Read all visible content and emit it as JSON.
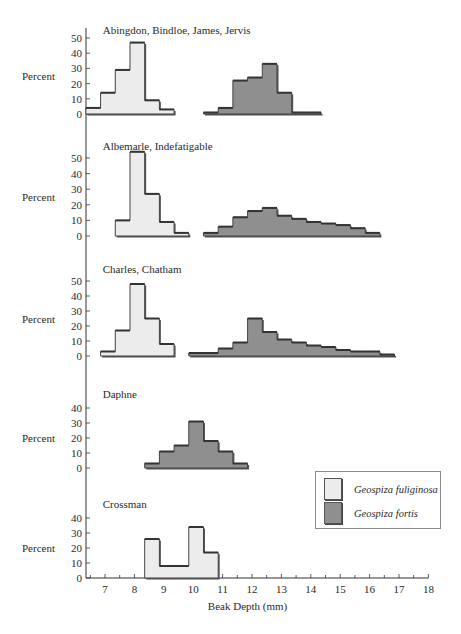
{
  "chart_data": {
    "type": "bar",
    "subtype": "stacked-panel histogram",
    "xlabel": "Beak Depth (mm)",
    "ylabel": "Percent",
    "x_ticks": [
      7,
      8,
      9,
      10,
      11,
      12,
      13,
      14,
      15,
      16,
      17,
      18
    ],
    "xlim": [
      6.5,
      18
    ],
    "bin_width_mm": 0.5,
    "colors": {
      "Geospiza fuliginosa": "#ececec",
      "Geospiza fortis": "#8f8f8f",
      "outline": "#444444"
    },
    "legend": {
      "position": "lower right",
      "entries": [
        {
          "label": "Geospiza fuliginosa",
          "color": "#ececec"
        },
        {
          "label": "Geospiza fortis",
          "color": "#8f8f8f"
        }
      ]
    },
    "panels": [
      {
        "title": "Abingdon, Bindloe, James, Jervis",
        "y_ticks": [
          0,
          10,
          20,
          30,
          40,
          50
        ],
        "ylim": [
          0,
          50
        ],
        "series": [
          {
            "name": "Geospiza fuliginosa",
            "bins": [
              [
                6.35,
                6.85,
                4
              ],
              [
                6.85,
                7.35,
                14
              ],
              [
                7.35,
                7.85,
                29
              ],
              [
                7.85,
                8.35,
                47
              ],
              [
                8.35,
                8.85,
                9
              ],
              [
                8.85,
                9.35,
                3
              ]
            ]
          },
          {
            "name": "Geospiza fortis",
            "bins": [
              [
                10.35,
                10.85,
                1
              ],
              [
                10.85,
                11.35,
                4
              ],
              [
                11.35,
                11.85,
                22
              ],
              [
                11.85,
                12.35,
                24
              ],
              [
                12.35,
                12.85,
                33
              ],
              [
                12.85,
                13.35,
                14
              ],
              [
                13.35,
                13.85,
                1
              ],
              [
                13.85,
                14.35,
                1
              ]
            ]
          }
        ]
      },
      {
        "title": "Albemarle, Indefatigable",
        "y_ticks": [
          0,
          10,
          20,
          30,
          40,
          50
        ],
        "ylim": [
          0,
          55
        ],
        "series": [
          {
            "name": "Geospiza fuliginosa",
            "bins": [
              [
                7.35,
                7.85,
                10
              ],
              [
                7.85,
                8.35,
                54
              ],
              [
                8.35,
                8.85,
                27
              ],
              [
                8.85,
                9.35,
                9
              ],
              [
                9.35,
                9.85,
                2
              ]
            ]
          },
          {
            "name": "Geospiza fortis",
            "bins": [
              [
                10.35,
                10.85,
                2
              ],
              [
                10.85,
                11.35,
                6
              ],
              [
                11.35,
                11.85,
                12
              ],
              [
                11.85,
                12.35,
                16
              ],
              [
                12.35,
                12.85,
                18
              ],
              [
                12.85,
                13.35,
                13
              ],
              [
                13.35,
                13.85,
                11
              ],
              [
                13.85,
                14.35,
                9
              ],
              [
                14.35,
                14.85,
                8
              ],
              [
                14.85,
                15.35,
                7
              ],
              [
                15.35,
                15.85,
                5
              ],
              [
                15.85,
                16.35,
                2
              ]
            ]
          }
        ]
      },
      {
        "title": "Charles, Chatham",
        "y_ticks": [
          0,
          10,
          20,
          30,
          40,
          50
        ],
        "ylim": [
          0,
          50
        ],
        "series": [
          {
            "name": "Geospiza fuliginosa",
            "bins": [
              [
                6.85,
                7.35,
                3
              ],
              [
                7.35,
                7.85,
                17
              ],
              [
                7.85,
                8.35,
                48
              ],
              [
                8.35,
                8.85,
                25
              ],
              [
                8.85,
                9.35,
                8
              ]
            ]
          },
          {
            "name": "Geospiza fortis",
            "bins": [
              [
                9.85,
                10.85,
                2
              ],
              [
                10.85,
                11.35,
                5
              ],
              [
                11.35,
                11.85,
                9
              ],
              [
                11.85,
                12.35,
                25
              ],
              [
                12.35,
                12.85,
                16
              ],
              [
                12.85,
                13.35,
                11
              ],
              [
                13.35,
                13.85,
                9
              ],
              [
                13.85,
                14.35,
                7
              ],
              [
                14.35,
                14.85,
                6
              ],
              [
                14.85,
                15.35,
                4
              ],
              [
                15.35,
                15.85,
                3
              ],
              [
                15.85,
                16.35,
                3
              ],
              [
                16.35,
                16.85,
                1
              ]
            ]
          }
        ]
      },
      {
        "title": "Daphne",
        "y_ticks": [
          0,
          10,
          20,
          30,
          40
        ],
        "ylim": [
          0,
          40
        ],
        "series": [
          {
            "name": "Geospiza fortis",
            "bins": [
              [
                8.35,
                8.85,
                3
              ],
              [
                8.85,
                9.35,
                11
              ],
              [
                9.35,
                9.85,
                15
              ],
              [
                9.85,
                10.35,
                31
              ],
              [
                10.35,
                10.85,
                18
              ],
              [
                10.85,
                11.35,
                11
              ],
              [
                11.35,
                11.85,
                3
              ]
            ]
          }
        ]
      },
      {
        "title": "Crossman",
        "y_ticks": [
          0,
          10,
          20,
          30,
          40
        ],
        "ylim": [
          0,
          40
        ],
        "series": [
          {
            "name": "Geospiza fuliginosa",
            "bins": [
              [
                8.35,
                8.85,
                26
              ],
              [
                8.85,
                9.85,
                8
              ],
              [
                9.85,
                10.35,
                34
              ],
              [
                10.35,
                10.85,
                17
              ]
            ]
          }
        ]
      }
    ]
  },
  "layout": {
    "x_px_per_mm": 29.4,
    "x_origin_mm": 7,
    "x_origin_px": 105,
    "axis_x_px": 86,
    "panel_baselines_px": [
      114,
      236,
      356,
      468,
      578
    ],
    "panel_px_per_unit": [
      1.52,
      1.56,
      1.5,
      1.5,
      1.5
    ]
  }
}
